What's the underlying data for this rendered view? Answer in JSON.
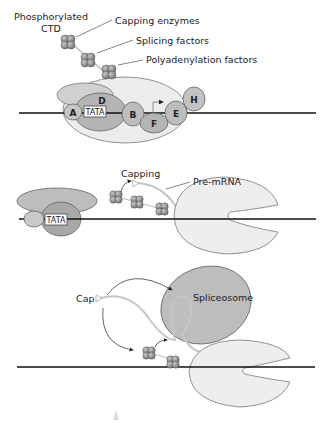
{
  "colors": {
    "light_gray": "#e9e9e9",
    "mid_gray": "#c4c4c4",
    "dark_gray": "#9a9a9a",
    "sphere": "#8a8a8a",
    "rna": "#bdbdbd",
    "dna": "#111111"
  },
  "panel1": {
    "labels": {
      "ctd_line1": "Phosphorylated",
      "ctd_line2": "CTD",
      "capping": "Capping enzymes",
      "splicing": "Splicing factors",
      "polyadenylation": "Polyadenylation factors"
    },
    "factors": {
      "a": "A",
      "d": "D",
      "tata": "TATA",
      "b": "B",
      "f": "F",
      "e": "E",
      "h": "H"
    }
  },
  "panel2": {
    "labels": {
      "capping": "Capping",
      "pre_mrna": "Pre-mRNA",
      "tata": "TATA"
    }
  },
  "panel3": {
    "labels": {
      "cap": "Cap",
      "spliceosome": "Spliceosome"
    }
  }
}
